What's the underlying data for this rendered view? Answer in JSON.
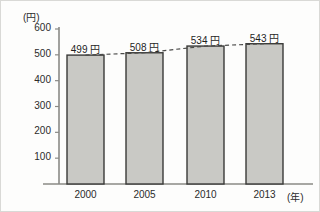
{
  "chart_data": {
    "type": "bar",
    "title": "",
    "xlabel": "(年)",
    "ylabel": "(円)",
    "categories": [
      "2000",
      "2005",
      "2010",
      "2013"
    ],
    "values": [
      499,
      508,
      534,
      543
    ],
    "value_labels": [
      "499 円",
      "508 円",
      "534 円",
      "543 円"
    ],
    "ylim": [
      0,
      600
    ],
    "yticks": [
      600,
      500,
      400,
      300,
      200,
      100
    ],
    "ytick_labels": [
      "600",
      "500",
      "400",
      "300",
      "200",
      "100"
    ],
    "grid": false,
    "legend": "none",
    "series": [
      {
        "name": "価格",
        "type": "bar",
        "values": [
          499,
          508,
          534,
          543
        ]
      },
      {
        "name": "trend",
        "type": "line",
        "style": "dashed",
        "values": [
          499,
          508,
          534,
          543
        ]
      }
    ],
    "colors": {
      "bar_fill": "#c9c9c5",
      "bar_stroke": "#3a3a38",
      "axis": "#8a8a86",
      "text": "#2b2b2b",
      "trend_line": "#4a4a48"
    }
  },
  "geometry": {
    "axis_x": 58,
    "axis_y_top": 28,
    "axis_y_bottom": 183,
    "axis_x_right": 312,
    "bar_width": 37,
    "bar_lefts": [
      66,
      125,
      186,
      245
    ],
    "bar_tops": [
      56,
      53,
      45,
      42
    ],
    "tick_ys": [
      28,
      55,
      81,
      107,
      133,
      159
    ],
    "label_ys": [
      43,
      40,
      32,
      29
    ]
  }
}
